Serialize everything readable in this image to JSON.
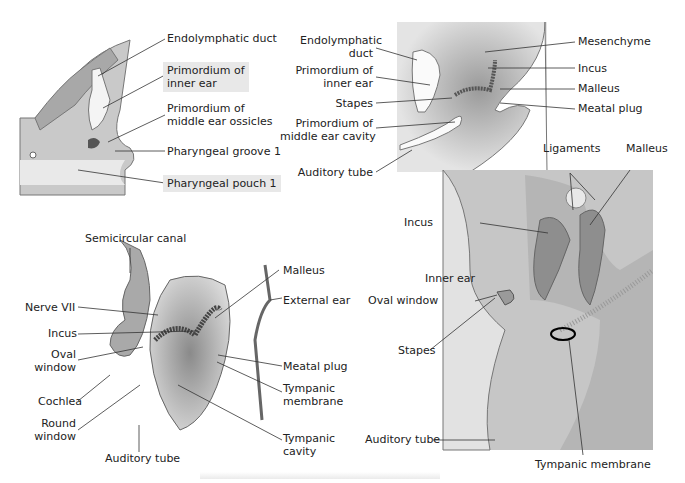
{
  "panels": [
    {
      "id": "a",
      "labels": [
        "Endolymphatic duct",
        "Primordium of inner ear",
        "Primordium of middle ear ossicles",
        "Pharyngeal groove 1",
        "Pharyngeal pouch 1"
      ]
    },
    {
      "id": "b",
      "labels": [
        "Endolymphatic duct",
        "Primordium of inner ear",
        "Stapes",
        "Primordium of middle ear cavity",
        "Auditory tube",
        "Mesenchyme",
        "Incus",
        "Malleus",
        "Meatal plug"
      ]
    },
    {
      "id": "c",
      "labels": [
        "Semicircular canal",
        "Nerve VII",
        "Incus",
        "Oval window",
        "Cochlea",
        "Round window",
        "Auditory tube",
        "Malleus",
        "External ear",
        "Meatal plug",
        "Tympanic membrane",
        "Tympanic cavity"
      ]
    },
    {
      "id": "d",
      "labels": [
        "Ligaments",
        "Malleus",
        "Incus",
        "Inner ear",
        "Oval window",
        "Stapes",
        "Auditory tube",
        "Tympanic membrane"
      ]
    }
  ],
  "a": {
    "endo": "Endolymphatic duct",
    "inner1": "Primordium of",
    "inner2": "inner ear",
    "oss1": "Primordium of",
    "oss2": "middle ear ossicles",
    "groove": "Pharyngeal groove 1",
    "pouch": "Pharyngeal pouch 1"
  },
  "b": {
    "endo1": "Endolymphatic",
    "endo2": "duct",
    "inner1": "Primordium of",
    "inner2": "inner ear",
    "stapes": "Stapes",
    "cav1": "Primordium of",
    "cav2": "middle ear cavity",
    "tube": "Auditory tube",
    "mes": "Mesenchyme",
    "incus": "Incus",
    "malleus": "Malleus",
    "plug": "Meatal plug"
  },
  "c": {
    "semi": "Semicircular canal",
    "nerve": "Nerve VII",
    "incus": "Incus",
    "oval1": "Oval",
    "oval2": "window",
    "cochlea": "Cochlea",
    "round1": "Round",
    "round2": "window",
    "tube": "Auditory tube",
    "malleus": "Malleus",
    "ext": "External ear",
    "plug": "Meatal plug",
    "tm1": "Tympanic",
    "tm2": "membrane",
    "tc1": "Tympanic",
    "tc2": "cavity"
  },
  "d": {
    "lig": "Ligaments",
    "malleus": "Malleus",
    "incus": "Incus",
    "inner": "Inner ear",
    "oval": "Oval window",
    "stapes": "Stapes",
    "tube": "Auditory tube",
    "tm": "Tympanic membrane"
  }
}
